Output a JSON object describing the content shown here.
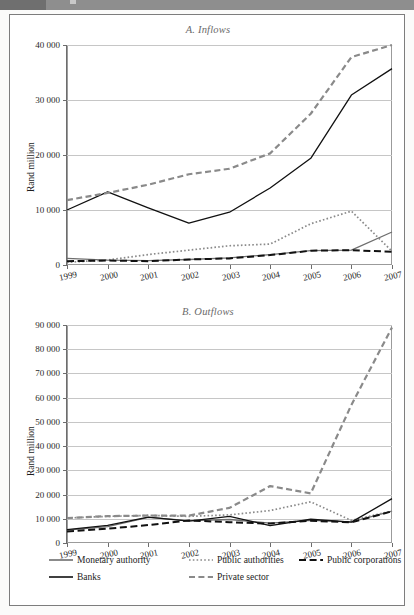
{
  "figure": {
    "y_axis_label": "Rand million",
    "legend": [
      {
        "label": "Monetary authority",
        "style": "solid",
        "color": "#6e6e6e"
      },
      {
        "label": "Public authorities",
        "style": "dotted",
        "color": "#8a8a8a"
      },
      {
        "label": "Public corporations",
        "style": "dashed-long",
        "color": "#111111"
      },
      {
        "label": "Banks",
        "style": "solid",
        "color": "#111111"
      },
      {
        "label": "Private sector",
        "style": "dashed",
        "color": "#8a8a8a"
      }
    ]
  },
  "chart_data": [
    {
      "type": "line",
      "title": "A. Inflows",
      "xlabel": "",
      "ylabel": "Rand million",
      "categories": [
        "1999",
        "2000",
        "2001",
        "2002",
        "2003",
        "2004",
        "2005",
        "2006",
        "2007"
      ],
      "ylim": [
        0,
        40000
      ],
      "yticks": [
        "0",
        "10 000",
        "20 000",
        "30 000",
        "40 000"
      ],
      "ytick_values": [
        0,
        10000,
        20000,
        30000,
        40000
      ],
      "grid": true,
      "legend_position": "bottom",
      "series": [
        {
          "name": "Monetary authority",
          "style": "solid",
          "color": "#6e6e6e",
          "values": [
            1200,
            900,
            800,
            1000,
            1300,
            1900,
            2600,
            2700,
            6000
          ]
        },
        {
          "name": "Public authorities",
          "style": "dotted",
          "color": "#8a8a8a",
          "values": [
            500,
            900,
            1900,
            2700,
            3500,
            3800,
            7500,
            9800,
            2500
          ]
        },
        {
          "name": "Public corporations",
          "style": "dashed-long",
          "color": "#111111",
          "values": [
            700,
            800,
            700,
            1000,
            1200,
            1800,
            2600,
            2700,
            2400
          ]
        },
        {
          "name": "Banks",
          "style": "solid",
          "color": "#111111",
          "values": [
            10000,
            13300,
            10400,
            7600,
            9600,
            14000,
            19400,
            30900,
            35700
          ]
        },
        {
          "name": "Private sector",
          "style": "dashed",
          "color": "#8a8a8a",
          "values": [
            11800,
            13100,
            14600,
            16500,
            17500,
            20300,
            27500,
            37800,
            40000
          ]
        }
      ]
    },
    {
      "type": "line",
      "title": "B. Outflows",
      "xlabel": "",
      "ylabel": "Rand million",
      "categories": [
        "1999",
        "2000",
        "2001",
        "2002",
        "2003",
        "2004",
        "2005",
        "2006",
        "2007"
      ],
      "ylim": [
        0,
        90000
      ],
      "yticks": [
        "0",
        "10 000",
        "20 000",
        "30 000",
        "40 000",
        "50 000",
        "60 000",
        "70 000",
        "80 000",
        "90 000"
      ],
      "ytick_values": [
        0,
        10000,
        20000,
        30000,
        40000,
        50000,
        60000,
        70000,
        80000,
        90000
      ],
      "grid": true,
      "legend_position": "bottom",
      "series": [
        {
          "name": "Monetary authority",
          "style": "solid",
          "color": "#6e6e6e",
          "values": [
            5300,
            6800,
            10600,
            9200,
            9700,
            8200,
            9300,
            8700,
            13200
          ]
        },
        {
          "name": "Public authorities",
          "style": "dotted",
          "color": "#8a8a8a",
          "values": [
            10300,
            11000,
            11400,
            11000,
            11600,
            13400,
            17000,
            9300,
            13200
          ]
        },
        {
          "name": "Public corporations",
          "style": "dashed-long",
          "color": "#111111",
          "values": [
            4700,
            5900,
            7400,
            9300,
            8600,
            8000,
            9200,
            8500,
            13100
          ]
        },
        {
          "name": "Banks",
          "style": "solid",
          "color": "#111111",
          "values": [
            5500,
            7300,
            10700,
            9000,
            11000,
            7200,
            9800,
            8600,
            18300
          ]
        },
        {
          "name": "Private sector",
          "style": "dashed",
          "color": "#8a8a8a",
          "values": [
            10300,
            11100,
            11300,
            11300,
            14500,
            23500,
            20500,
            57000,
            89000
          ]
        }
      ]
    }
  ]
}
